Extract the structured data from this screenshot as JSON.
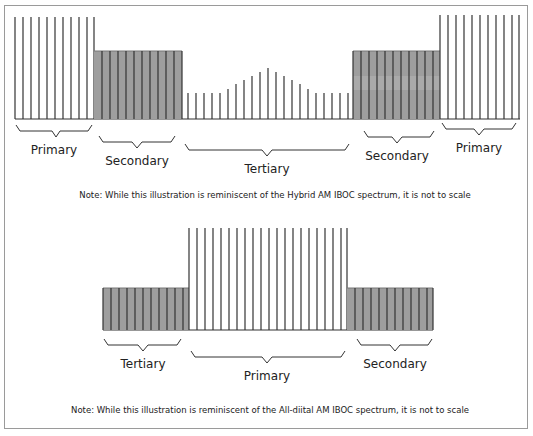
{
  "diagrams": [
    {
      "title": "Hybrid AM IBOC spectrum",
      "note": "Note: While this illustration is reminiscent of the Hybrid AM IBOC spectrum, it is not to scale",
      "bands": [
        {
          "label": "Primary",
          "type": "lines",
          "x0": 15,
          "x1": 94,
          "height_level": "high"
        },
        {
          "label": "Secondary",
          "type": "shaded",
          "x0": 94,
          "x1": 182,
          "height_level": "mid"
        },
        {
          "label": "Tertiary",
          "type": "lines-peaked",
          "x0": 182,
          "x1": 353,
          "height_level": "low"
        },
        {
          "label": "Secondary",
          "type": "shaded",
          "x0": 353,
          "x1": 440,
          "height_level": "mid"
        },
        {
          "label": "Primary",
          "type": "lines",
          "x0": 440,
          "x1": 520,
          "height_level": "high"
        }
      ]
    },
    {
      "title": "All-digital AM IBOC spectrum",
      "note": "Note: While this illustration is reminiscent of the All-diital AM IBOC spectrum, it is not to scale",
      "bands": [
        {
          "label": "Tertiary",
          "type": "shaded",
          "x0": 103,
          "x1": 189,
          "height_level": "mid"
        },
        {
          "label": "Primary",
          "type": "lines",
          "x0": 189,
          "x1": 347,
          "height_level": "high"
        },
        {
          "label": "Secondary",
          "type": "shaded",
          "x0": 347,
          "x1": 433,
          "height_level": "mid"
        }
      ]
    }
  ],
  "colors": {
    "shade": "#9e9e9e",
    "line": "#333333",
    "border": "#9a9a9a"
  }
}
